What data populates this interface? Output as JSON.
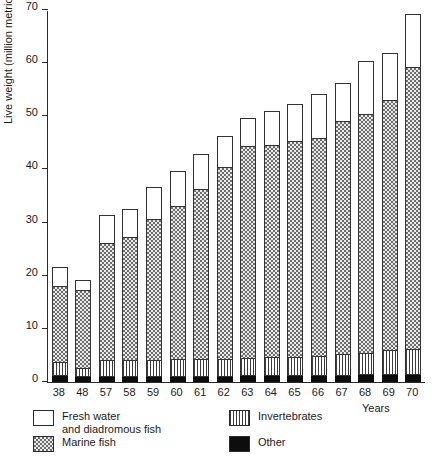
{
  "chart_data": {
    "type": "bar",
    "stacked": true,
    "title": "",
    "xlabel": "Years",
    "ylabel": "Live weight (million metric tons)",
    "ylim": [
      0,
      70
    ],
    "yticks": [
      0,
      10,
      20,
      30,
      40,
      50,
      60,
      70
    ],
    "grid": false,
    "legend_position": "below-axes",
    "categories": [
      "38",
      "48",
      "57",
      "58",
      "59",
      "60",
      "61",
      "62",
      "63",
      "64",
      "65",
      "66",
      "67",
      "68",
      "69",
      "70"
    ],
    "series": [
      {
        "name": "Other",
        "swatch": "solid-black",
        "color": "#0d0d0d",
        "values": [
          1.1,
          0.9,
          1.0,
          1.0,
          1.0,
          1.0,
          1.0,
          1.0,
          1.1,
          1.1,
          1.1,
          1.2,
          1.2,
          1.3,
          1.4,
          1.4
        ]
      },
      {
        "name": "Invertebrates",
        "swatch": "vertical-stripes",
        "color": "#3c3c3c",
        "values": [
          2.4,
          1.6,
          2.9,
          2.9,
          3.0,
          3.1,
          3.2,
          3.2,
          3.3,
          3.4,
          3.5,
          3.6,
          3.8,
          4.0,
          4.5,
          4.7
        ]
      },
      {
        "name": "Marine fish",
        "swatch": "stipple",
        "color": "#e9e9e9",
        "values": [
          14.3,
          14.6,
          22.1,
          23.2,
          26.4,
          28.8,
          32.0,
          36.0,
          39.9,
          40.0,
          40.6,
          40.9,
          44.0,
          45.0,
          47.0,
          53.0
        ]
      },
      {
        "name": "Fresh water and diadromous fish",
        "swatch": "white",
        "color": "#ffffff",
        "values": [
          3.7,
          2.0,
          5.3,
          5.3,
          6.2,
          6.7,
          6.6,
          5.9,
          5.2,
          6.3,
          6.9,
          8.4,
          7.1,
          9.9,
          8.9,
          9.9
        ]
      }
    ],
    "totals": [
      21.5,
      19.1,
      31.3,
      32.4,
      36.6,
      39.6,
      42.8,
      46.1,
      49.5,
      50.8,
      52.1,
      54.1,
      56.1,
      60.2,
      61.8,
      69.0
    ]
  },
  "legend": {
    "items": [
      {
        "label": "Fresh water\nand diadromous  fish",
        "pattern": "white"
      },
      {
        "label": "Invertebrates",
        "pattern": "vertical-stripes"
      },
      {
        "label": "Marine fish",
        "pattern": "stipple"
      },
      {
        "label": "Other",
        "pattern": "solid-black"
      }
    ]
  },
  "axes": {
    "y_title": "Live weight (million metric tons)",
    "x_title": "Years"
  }
}
